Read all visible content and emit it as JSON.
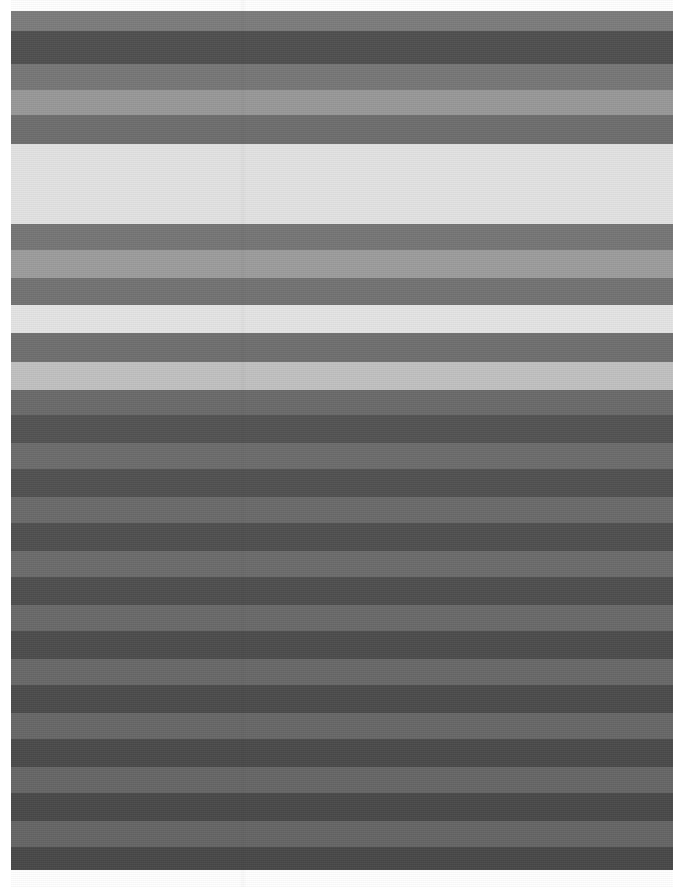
{
  "image": {
    "title": "Horizontal Grayscale Stripe Pattern",
    "width": 683,
    "height": 887,
    "background_color": "#ffffff",
    "margins": {
      "top": 11,
      "left": 11,
      "right": 10,
      "bottom": 17
    }
  },
  "palette": {
    "white": "#ffffff",
    "very_light": "#e2e2e2",
    "light_gray": "#c9c9c9",
    "light_medium": "#9a9a9a",
    "medium": "#7f7f7f",
    "medium_dark": "#6f6f6f",
    "dark": "#565656",
    "darker": "#4a4a4a",
    "darkest": "#3f3f3f"
  },
  "chart_data": {
    "type": "bar",
    "xlabel": "",
    "ylabel": "Vertical position (px)",
    "ylim": [
      0,
      887
    ],
    "grid": false,
    "legend": "none",
    "categories": [
      "band-01",
      "band-02",
      "band-03",
      "band-04",
      "band-05",
      "band-06",
      "band-07",
      "band-08",
      "band-09",
      "band-10",
      "band-11",
      "band-12",
      "band-13",
      "band-14",
      "band-15",
      "band-16",
      "band-17",
      "band-18",
      "band-19",
      "band-20",
      "band-21",
      "band-22",
      "band-23",
      "band-24",
      "band-25",
      "band-26",
      "band-27",
      "band-28",
      "band-29",
      "band-30",
      "band-31",
      "band-32",
      "band-33",
      "band-34",
      "band-35",
      "band-36",
      "band-37"
    ],
    "values": [
      20,
      33,
      26,
      25,
      29,
      80,
      26,
      28,
      27,
      28,
      29,
      28,
      25,
      28,
      26,
      28,
      26,
      28,
      26,
      28,
      26,
      28,
      26,
      28,
      26,
      28,
      26,
      28,
      26,
      28,
      26,
      28,
      26,
      28,
      26,
      28,
      26
    ]
  },
  "bands": [
    {
      "name": "band-01",
      "top": 11,
      "height": 20,
      "color": "#7c7c7c",
      "tone": "medium"
    },
    {
      "name": "band-02",
      "top": 31,
      "height": 33,
      "color": "#4f4f4f",
      "tone": "dark"
    },
    {
      "name": "band-03",
      "top": 64,
      "height": 26,
      "color": "#777777",
      "tone": "medium"
    },
    {
      "name": "band-04",
      "top": 90,
      "height": 25,
      "color": "#989898",
      "tone": "light-medium"
    },
    {
      "name": "band-05",
      "top": 115,
      "height": 29,
      "color": "#6e6e6e",
      "tone": "medium-dark"
    },
    {
      "name": "band-06",
      "top": 144,
      "height": 80,
      "color": "#e2e2e2",
      "tone": "very-light"
    },
    {
      "name": "band-07",
      "top": 224,
      "height": 26,
      "color": "#767676",
      "tone": "medium"
    },
    {
      "name": "band-08",
      "top": 250,
      "height": 28,
      "color": "#9c9c9c",
      "tone": "light-medium"
    },
    {
      "name": "band-09",
      "top": 278,
      "height": 27,
      "color": "#737373",
      "tone": "medium"
    },
    {
      "name": "band-10",
      "top": 305,
      "height": 28,
      "color": "#e4e4e4",
      "tone": "very-light"
    },
    {
      "name": "band-11",
      "top": 333,
      "height": 29,
      "color": "#6f6f6f",
      "tone": "medium-dark"
    },
    {
      "name": "band-12",
      "top": 362,
      "height": 28,
      "color": "#c0c0c0",
      "tone": "light-gray"
    },
    {
      "name": "band-13",
      "top": 390,
      "height": 25,
      "color": "#6a6a6a",
      "tone": "medium-dark"
    },
    {
      "name": "band-14",
      "top": 415,
      "height": 28,
      "color": "#535353",
      "tone": "dark"
    },
    {
      "name": "band-15",
      "top": 443,
      "height": 26,
      "color": "#6c6c6c",
      "tone": "medium-dark"
    },
    {
      "name": "band-16",
      "top": 469,
      "height": 28,
      "color": "#515151",
      "tone": "dark"
    },
    {
      "name": "band-17",
      "top": 497,
      "height": 26,
      "color": "#6a6a6a",
      "tone": "medium-dark"
    },
    {
      "name": "band-18",
      "top": 523,
      "height": 28,
      "color": "#4f4f4f",
      "tone": "dark"
    },
    {
      "name": "band-19",
      "top": 551,
      "height": 26,
      "color": "#6b6b6b",
      "tone": "medium-dark"
    },
    {
      "name": "band-20",
      "top": 577,
      "height": 28,
      "color": "#4e4e4e",
      "tone": "dark"
    },
    {
      "name": "band-21",
      "top": 605,
      "height": 26,
      "color": "#696969",
      "tone": "medium-dark"
    },
    {
      "name": "band-22",
      "top": 631,
      "height": 28,
      "color": "#4c4c4c",
      "tone": "dark"
    },
    {
      "name": "band-23",
      "top": 659,
      "height": 26,
      "color": "#686868",
      "tone": "medium-dark"
    },
    {
      "name": "band-24",
      "top": 685,
      "height": 28,
      "color": "#4b4b4b",
      "tone": "dark"
    },
    {
      "name": "band-25",
      "top": 713,
      "height": 26,
      "color": "#676767",
      "tone": "medium-dark"
    },
    {
      "name": "band-26",
      "top": 739,
      "height": 28,
      "color": "#4a4a4a",
      "tone": "dark"
    },
    {
      "name": "band-27",
      "top": 767,
      "height": 26,
      "color": "#666666",
      "tone": "medium-dark"
    },
    {
      "name": "band-28",
      "top": 793,
      "height": 28,
      "color": "#494949",
      "tone": "dark"
    },
    {
      "name": "band-29",
      "top": 821,
      "height": 26,
      "color": "#656565",
      "tone": "medium-dark"
    },
    {
      "name": "band-30",
      "top": 847,
      "height": 23,
      "color": "#484848",
      "tone": "dark"
    }
  ]
}
